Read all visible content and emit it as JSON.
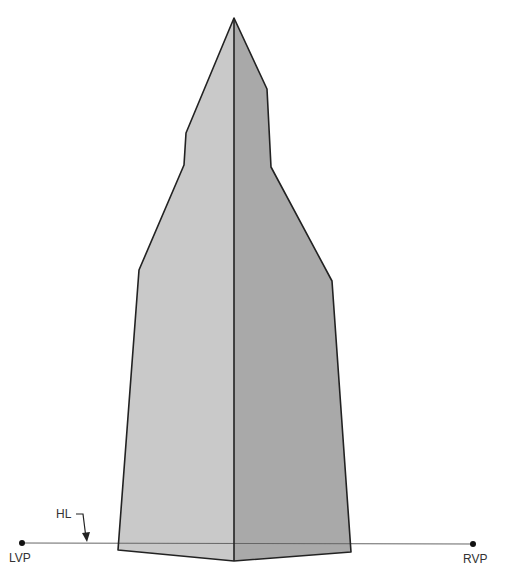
{
  "diagram": {
    "type": "two-point perspective spire",
    "labels": {
      "horizon_line": "HL",
      "left_vanishing_point": "LVP",
      "right_vanishing_point": "RVP"
    },
    "colors": {
      "left_face": "#c9c9c9",
      "right_face": "#a9a9a9",
      "outline": "#222222",
      "horizon": "#555555"
    }
  }
}
